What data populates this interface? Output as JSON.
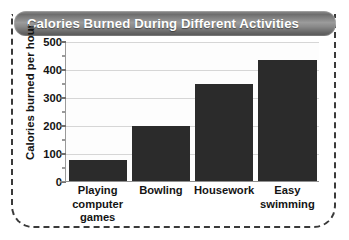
{
  "chart_data": {
    "type": "bar",
    "title": "Calories Burned During Different Activities",
    "xlabel": "",
    "ylabel": "Calories burned per hour",
    "categories": [
      "Playing computer games",
      "Bowling",
      "Housework",
      "Easy swimming"
    ],
    "category_lines": [
      [
        "Playing",
        "computer",
        "games"
      ],
      [
        "Bowling"
      ],
      [
        "Housework"
      ],
      [
        "Easy",
        "swimming"
      ]
    ],
    "values": [
      78,
      200,
      350,
      435
    ],
    "ylim": [
      0,
      500
    ],
    "y_ticks": [
      0,
      100,
      200,
      300,
      400,
      500
    ],
    "y_tick_labels": [
      "0",
      "100",
      "200",
      "300",
      "400",
      "500"
    ],
    "y_minor_ticks": [
      50,
      150,
      250,
      350,
      450
    ],
    "grid": true,
    "legend": null,
    "bar_color": "#2b2b2b",
    "gridline_color": "#d6d6d6",
    "title_text_color": "#ffffff",
    "title_bar_color": "#8a8a8a",
    "frame_color": "#3a3a3a",
    "plot_background": "#fdfdfd"
  }
}
